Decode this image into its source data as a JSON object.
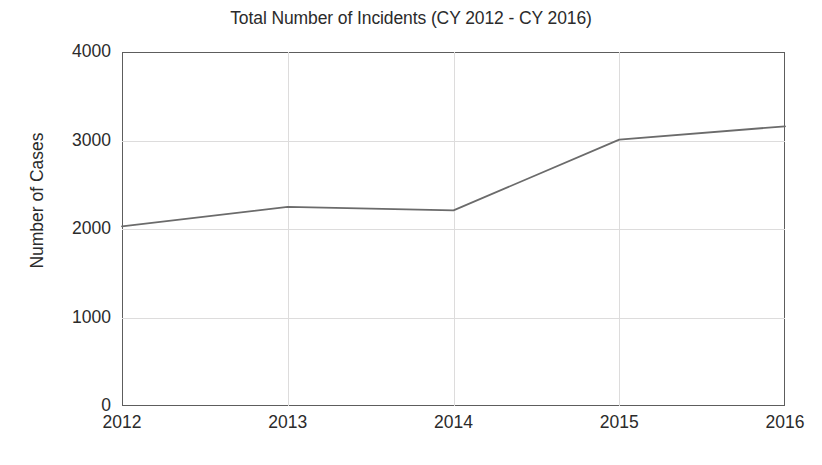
{
  "chart_data": {
    "type": "line",
    "title": "Total Number of Incidents (CY 2012 - CY 2016)",
    "xlabel": "",
    "ylabel": "Number of Cases",
    "categories": [
      "2012",
      "2013",
      "2014",
      "2015",
      "2016"
    ],
    "x": [
      2012,
      2013,
      2014,
      2015,
      2016
    ],
    "values": [
      2030,
      2250,
      2210,
      3010,
      3160
    ],
    "series": [
      {
        "name": "Total Number of Incidents",
        "values": [
          2030,
          2250,
          2210,
          3010,
          3160
        ]
      }
    ],
    "xlim": [
      2012,
      2016
    ],
    "ylim": [
      0,
      4000
    ],
    "yticks": [
      "0",
      "1000",
      "2000",
      "3000",
      "4000"
    ],
    "ytick_values": [
      0,
      1000,
      2000,
      3000,
      4000
    ],
    "xticks": [
      "2012",
      "2013",
      "2014",
      "2015",
      "2016"
    ],
    "grid": true,
    "legend": false,
    "legend_position": "none",
    "line_color": "#6b6b6b",
    "axis_color": "#5d5d5d",
    "grid_color": "#dddcdc",
    "background_color": "#ffffff",
    "markers": false
  }
}
